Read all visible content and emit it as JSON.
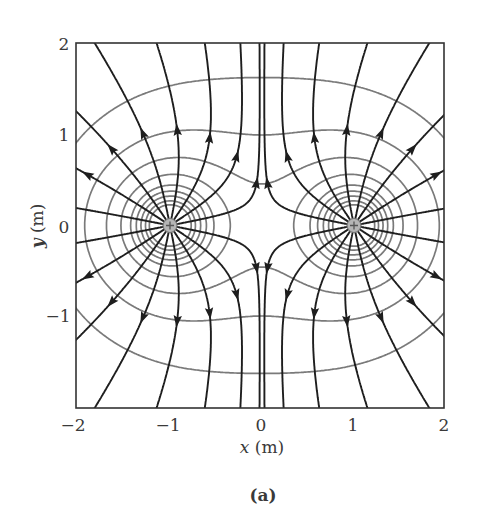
{
  "figure": {
    "caption": "(a)",
    "x_axis": {
      "var": "x",
      "unit": " (m)",
      "ticks": [
        "−2",
        "−1",
        "0",
        "1",
        "2"
      ],
      "range": [
        -2,
        2
      ]
    },
    "y_axis": {
      "var": "y",
      "unit": " (m)",
      "ticks": [
        "2",
        "1",
        "0",
        "−1"
      ],
      "range": [
        -2,
        2
      ]
    },
    "charges": [
      {
        "x": -1,
        "y": 0,
        "sign": "+",
        "q": 1
      },
      {
        "x": 1,
        "y": 0,
        "sign": "+",
        "q": 1
      }
    ],
    "field_lines_per_charge": 16,
    "field_line_angle_offset_deg": 11.25,
    "equipotential_levels": [
      1.05,
      1.42,
      1.82,
      2.27,
      2.75,
      3.15,
      3.6,
      4.2,
      4.9
    ],
    "colors": {
      "field_line": "#1e1e1e",
      "equipotential": "#7a7a7a",
      "frame": "#333333",
      "charge_fill": "#b5b5b5",
      "charge_stroke": "#777777"
    }
  }
}
